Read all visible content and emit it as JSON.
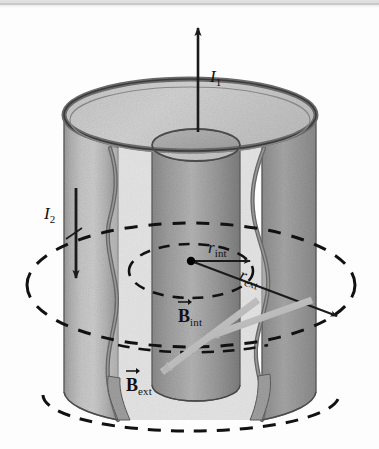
{
  "figure": {
    "background_color": "#fdfdfd"
  },
  "scan_artifact": {
    "top_band_color": "#e2e2e2",
    "rule_color": "#c9c9c9"
  },
  "labels": {
    "current_inner": {
      "base": "I",
      "subscript": "1",
      "name": "current-inner"
    },
    "current_outer": {
      "base": "I",
      "subscript": "2",
      "name": "current-outer"
    },
    "radius_inner": {
      "base": "r",
      "subscript": "int",
      "name": "radius-internal"
    },
    "radius_outer": {
      "base": "r",
      "subscript": "ext",
      "name": "radius-external"
    },
    "field_inner": {
      "base": "B",
      "subscript": "int",
      "name": "field-internal",
      "vector": true
    },
    "field_outer": {
      "base": "B",
      "subscript": "ext",
      "name": "field-external",
      "vector": true
    }
  },
  "colors": {
    "outline": "#2b2b2b",
    "shell_face": "#b9b9b9",
    "shell_top": "#c8c8c8",
    "shell_wall_dark": "#8f8f8f",
    "shell_wall_light": "#c2c2c2",
    "core_light": "#b5b5b5",
    "core_dark": "#7e7e7e",
    "rim_edge": "#767676",
    "dashed_line": "#111111",
    "pointer_gray": "#b0b0b0",
    "center_dot": "#000000"
  },
  "geometry": {
    "center_point": {
      "x": 191,
      "y": 260
    },
    "outer_cylinder": {
      "cx": 190,
      "rx": 126,
      "top_cy": 115,
      "bottom_cy": 392,
      "ry": 36
    },
    "inner_cylinder": {
      "cx": 196,
      "rx": 44,
      "top_cy": 145,
      "bottom_cy": 385,
      "ry": 16
    },
    "field_ellipse_internal": {
      "cx": 191,
      "cy": 271,
      "rx": 62,
      "ry": 27
    },
    "field_ellipse_external": {
      "cx": 191,
      "cy": 285,
      "rx": 164,
      "ry": 62
    },
    "bottom_field_ellipse": {
      "cx": 191,
      "cy": 395,
      "rx": 148,
      "ry": 36
    }
  },
  "annotations": {
    "arrow_current_inner_direction": "up",
    "arrow_current_outer_direction": "down",
    "arrow_radius_inner_direction": "right-horizontal",
    "arrow_radius_outer_direction": "down-right-diagonal",
    "pointer_field_internal": "gray arrow from upper-right to lower-left",
    "pointer_field_external": "gray arrow from upper-right to lower-left"
  }
}
